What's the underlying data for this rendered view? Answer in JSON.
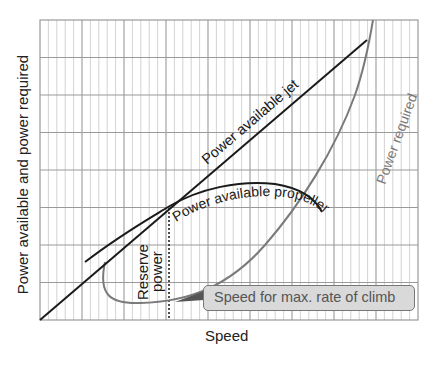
{
  "chart_data": {
    "type": "line",
    "title": "",
    "xlabel": "Speed",
    "ylabel": "Power available and power required",
    "grid": true,
    "legend": "none (curves labeled inline)",
    "axes_ticks": "none",
    "series": [
      {
        "name": "Power available jet",
        "color": "#1a1a1a",
        "shape": "straight line from origin rising steadily",
        "points": [
          [
            0,
            0
          ],
          [
            0.865,
            0.933
          ]
        ]
      },
      {
        "name": "Power available propeller",
        "color": "#1a1a1a",
        "shape": "concave curve peaking at mid-high speed",
        "points": [
          [
            0.119,
            0.193
          ],
          [
            0.22,
            0.36
          ],
          [
            0.34,
            0.43
          ],
          [
            0.53,
            0.457
          ],
          [
            0.67,
            0.42
          ],
          [
            0.745,
            0.36
          ]
        ]
      },
      {
        "name": "Power required",
        "color": "#777777",
        "shape": "U-shaped drag curve, minimum at low speed, rising steeply",
        "points": [
          [
            0.172,
            0.193
          ],
          [
            0.2,
            0.08
          ],
          [
            0.3,
            0.06
          ],
          [
            0.45,
            0.12
          ],
          [
            0.6,
            0.3
          ],
          [
            0.69,
            0.4
          ],
          [
            0.8,
            0.7
          ],
          [
            0.86,
            0.867
          ],
          [
            0.882,
            1.0
          ]
        ]
      }
    ],
    "annotations": [
      {
        "text": "Reserve power",
        "description": "Vertical gap between propeller power available and power required at the speed for max rate of climb"
      },
      {
        "text": "Speed for max. rate of climb",
        "description": "Callout pointing to the dotted vertical line"
      }
    ],
    "xlim": [
      0,
      1
    ],
    "ylim": [
      0,
      1
    ]
  },
  "labels": {
    "ylabel": "Power available and power required",
    "xlabel": "Speed",
    "jet": "Power available jet",
    "propeller": "Power available propeller",
    "required": "Power required",
    "reserve_line1": "Reserve",
    "reserve_line2": "power",
    "callout": "Speed for max. rate of climb"
  },
  "colors": {
    "grid_minor": "#c8c8c8",
    "grid_major": "#9a9a9a",
    "curve_dark": "#1a1a1a",
    "curve_gray": "#7a7a7a",
    "callout_fill": "#d9d9d9"
  }
}
